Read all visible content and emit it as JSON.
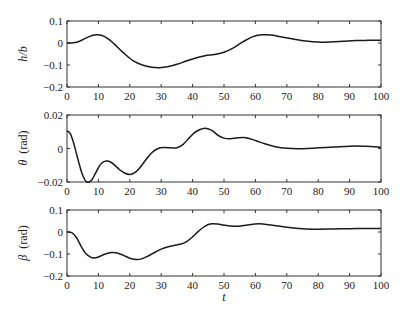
{
  "chart_data": [
    {
      "type": "line",
      "title": "",
      "xlabel": "",
      "ylabel": "h/b",
      "ylabel_parts": {
        "symbol": "h/b",
        "unit": ""
      },
      "xlim": [
        0,
        100
      ],
      "ylim": [
        -0.2,
        0.1
      ],
      "xticks": [
        0,
        10,
        20,
        30,
        40,
        50,
        60,
        70,
        80,
        90,
        100
      ],
      "yticks": [
        0.1,
        0,
        -0.1,
        -0.2
      ],
      "ytick_labels": [
        "0.1",
        "0",
        "−0.1",
        "−0.2"
      ],
      "grid": false,
      "series": [
        {
          "name": "h/b",
          "x": [
            0,
            2,
            4,
            6,
            8,
            9.5,
            11,
            13,
            15,
            18,
            21,
            24,
            27,
            29.5,
            32,
            35,
            38,
            41,
            44,
            47,
            50,
            53,
            56,
            59,
            62,
            65,
            68,
            72,
            76,
            80,
            84,
            88,
            92,
            96,
            100
          ],
          "y": [
            0,
            0.001,
            0.008,
            0.022,
            0.034,
            0.038,
            0.035,
            0.02,
            -0.004,
            -0.045,
            -0.08,
            -0.1,
            -0.11,
            -0.112,
            -0.108,
            -0.097,
            -0.082,
            -0.068,
            -0.058,
            -0.052,
            -0.042,
            -0.022,
            0.005,
            0.028,
            0.037,
            0.036,
            0.028,
            0.018,
            0.009,
            0.004,
            0.005,
            0.008,
            0.011,
            0.012,
            0.013
          ]
        }
      ]
    },
    {
      "type": "line",
      "title": "",
      "xlabel": "",
      "ylabel": "θ (rad)",
      "ylabel_parts": {
        "symbol": "θ",
        "unit": "(rad)"
      },
      "xlim": [
        0,
        100
      ],
      "ylim": [
        -0.02,
        0.02
      ],
      "xticks": [
        0,
        10,
        20,
        30,
        40,
        50,
        60,
        70,
        80,
        90,
        100
      ],
      "yticks": [
        0.02,
        0,
        -0.02
      ],
      "ytick_labels": [
        "0.02",
        "0",
        "−0.02"
      ],
      "grid": false,
      "series": [
        {
          "name": "theta",
          "x": [
            0,
            1,
            2,
            3,
            4,
            5,
            6,
            7,
            8,
            9,
            10,
            11,
            12.5,
            14,
            15.5,
            17,
            18.5,
            20,
            21.5,
            23,
            25,
            27,
            29,
            31,
            33,
            35,
            37,
            39,
            41,
            43.5,
            46,
            48,
            50,
            52,
            54.5,
            57,
            60,
            63,
            66,
            70,
            75,
            80,
            85,
            90,
            95,
            100
          ],
          "y": [
            0.0105,
            0.009,
            0.004,
            -0.003,
            -0.01,
            -0.016,
            -0.0195,
            -0.02,
            -0.0185,
            -0.015,
            -0.0115,
            -0.0088,
            -0.0075,
            -0.0082,
            -0.0105,
            -0.013,
            -0.0148,
            -0.0155,
            -0.0145,
            -0.012,
            -0.007,
            -0.0025,
            0.0,
            0.0006,
            0.0004,
            0.0004,
            0.0025,
            0.0065,
            0.01,
            0.012,
            0.011,
            0.008,
            0.0062,
            0.0058,
            0.0064,
            0.0064,
            0.0048,
            0.0028,
            0.0012,
            0.0001,
            -0.0001,
            0.0004,
            0.0009,
            0.0014,
            0.0013,
            0.0008
          ]
        }
      ]
    },
    {
      "type": "line",
      "title": "",
      "xlabel": "t",
      "ylabel": "β (rad)",
      "ylabel_parts": {
        "symbol": "β",
        "unit": "(rad)"
      },
      "xlim": [
        0,
        100
      ],
      "ylim": [
        -0.2,
        0.1
      ],
      "xticks": [
        0,
        10,
        20,
        30,
        40,
        50,
        60,
        70,
        80,
        90,
        100
      ],
      "yticks": [
        0.1,
        0,
        -0.1,
        -0.2
      ],
      "ytick_labels": [
        "0.1",
        "0",
        "−0.1",
        "−0.2"
      ],
      "grid": false,
      "series": [
        {
          "name": "beta",
          "x": [
            0,
            1.5,
            3,
            4.5,
            6,
            7.5,
            8.6,
            10,
            12,
            14.2,
            16,
            18,
            20,
            22.2,
            24,
            26,
            28,
            30,
            32,
            34,
            36,
            38,
            40,
            42,
            44,
            46,
            48,
            50,
            52,
            54,
            57,
            61,
            65,
            70,
            75,
            80,
            85,
            90,
            95,
            100
          ],
          "y": [
            0,
            -0.003,
            -0.025,
            -0.065,
            -0.098,
            -0.114,
            -0.118,
            -0.114,
            -0.101,
            -0.093,
            -0.095,
            -0.106,
            -0.119,
            -0.125,
            -0.121,
            -0.108,
            -0.092,
            -0.078,
            -0.068,
            -0.061,
            -0.056,
            -0.045,
            -0.022,
            0.005,
            0.027,
            0.037,
            0.036,
            0.031,
            0.027,
            0.026,
            0.031,
            0.037,
            0.032,
            0.022,
            0.015,
            0.013,
            0.014,
            0.015,
            0.016,
            0.016
          ]
        }
      ]
    }
  ],
  "xtick_labels": [
    "0",
    "10",
    "20",
    "30",
    "40",
    "50",
    "60",
    "70",
    "80",
    "90",
    "100"
  ],
  "shared_xlabel": "t",
  "line_color": "#1a1a1a"
}
